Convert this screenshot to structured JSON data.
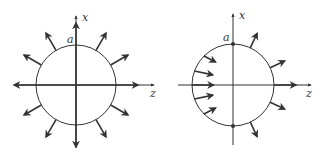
{
  "figure_left": {
    "description": "Uniform radial outward field lines from a sphere of radius a",
    "axis_x_label": "x",
    "axis_z_label": "z",
    "radius_label": "a",
    "center": [
      76,
      85
    ],
    "radius": 40,
    "arrow_angles_deg": [
      0,
      30,
      60,
      90,
      120,
      150,
      180,
      210,
      240,
      270,
      300,
      330
    ]
  },
  "figure_right": {
    "description": "Sphere with inward arrows on left hemisphere, outward arrows on right hemisphere",
    "axis_x_label": "x",
    "axis_z_label": "z",
    "radius_label": "a",
    "center": [
      233,
      85
    ],
    "radius": 41,
    "pole_dots": [
      "top",
      "bottom"
    ]
  },
  "colors": {
    "stroke": "#333333",
    "background": "#ffffff"
  }
}
